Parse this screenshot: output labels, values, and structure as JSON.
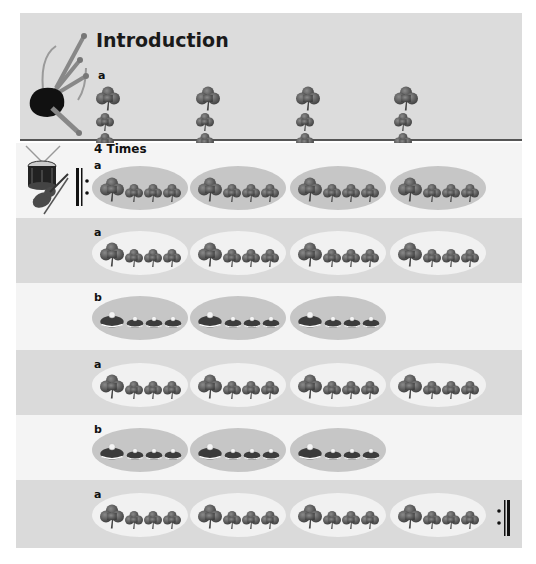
{
  "intro": {
    "title": "Introduction",
    "section_label": "a",
    "groups": 4,
    "icon": "bagpipes-icon",
    "pattern": [
      "big-clover",
      "small-clover",
      "small-clover",
      "small-clover"
    ]
  },
  "body": {
    "repeat_label": "4 Times",
    "icon": "drum-and-fiddle-icon",
    "start_repeat_sign": "repeat-start-icon",
    "end_repeat_sign": "repeat-end-icon",
    "rows": [
      {
        "label": "a",
        "symbol": "clover",
        "groups": 4,
        "background": "white",
        "ellipse": "dark"
      },
      {
        "label": "a",
        "symbol": "clover",
        "groups": 4,
        "background": "gray",
        "ellipse": "light"
      },
      {
        "label": "b",
        "symbol": "drum-cap",
        "groups": 3,
        "background": "white",
        "ellipse": "dark"
      },
      {
        "label": "a",
        "symbol": "clover",
        "groups": 4,
        "background": "gray",
        "ellipse": "light"
      },
      {
        "label": "b",
        "symbol": "drum-cap",
        "groups": 3,
        "background": "white",
        "ellipse": "dark"
      },
      {
        "label": "a",
        "symbol": "clover",
        "groups": 4,
        "background": "gray",
        "ellipse": "light"
      }
    ]
  },
  "colors": {
    "intro_bg": "#dcdcdc",
    "row_white": "#f4f4f4",
    "row_gray": "#dadada",
    "ellipse_dark": "#c6c6c6",
    "ellipse_light": "#f1f1f1",
    "symbol": "#555555"
  }
}
